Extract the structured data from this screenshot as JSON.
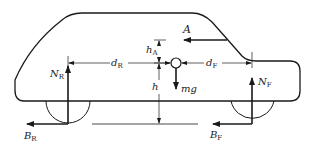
{
  "diagram": {
    "colors": {
      "line": "#1a1a1a",
      "background": "#ffffff"
    },
    "forces": {
      "aero_drag": {
        "symbol": "A"
      },
      "weight": {
        "symbol": "mg"
      },
      "rear_normal": {
        "symbol": "N",
        "subscript": "R"
      },
      "front_normal": {
        "symbol": "N",
        "subscript": "F"
      },
      "rear_braking": {
        "symbol": "B",
        "subscript": "R"
      },
      "front_braking": {
        "symbol": "B",
        "subscript": "F"
      }
    },
    "dimensions": {
      "rear_distance": {
        "symbol": "d",
        "subscript": "R"
      },
      "front_distance": {
        "symbol": "d",
        "subscript": "F"
      },
      "aero_height": {
        "symbol": "h",
        "subscript": "A"
      },
      "cg_height": {
        "symbol": "h"
      }
    },
    "components": [
      "car-body",
      "rear-wheel",
      "front-wheel",
      "center-of-gravity",
      "ground-line"
    ]
  }
}
